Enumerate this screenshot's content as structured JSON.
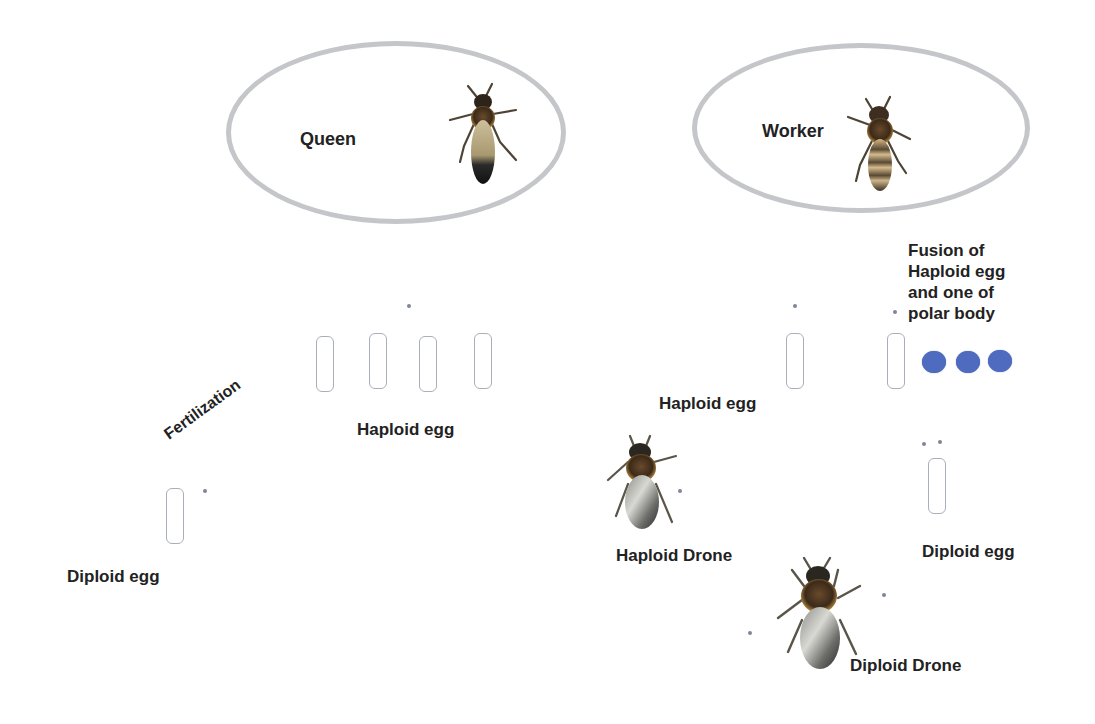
{
  "diagram": {
    "colors": {
      "background": "#ffffff",
      "ellipse_stroke": "#c4c6ca",
      "egg_outline": "#a9afb8",
      "polar_body": "#4f6bbf",
      "text": "#222222"
    },
    "left": {
      "caste_label": "Queen",
      "haploid_egg_label": "Haploid egg",
      "haploid_egg_count": 4,
      "process_label": "Fertilization",
      "diploid_egg_label": "Diploid egg"
    },
    "right": {
      "caste_label": "Worker",
      "haploid_egg_label": "Haploid egg",
      "fusion_label_lines": [
        "Fusion of",
        "Haploid egg",
        "and one of",
        "polar body"
      ],
      "polar_body_count": 3,
      "haploid_drone_label": "Haploid Drone",
      "diploid_egg_label": "Diploid egg",
      "diploid_drone_label": "Diploid Drone"
    },
    "icons": {
      "queen": "queen-bee-icon",
      "worker": "worker-bee-icon",
      "haploid_drone": "drone-bee-icon",
      "diploid_drone": "drone-bee-icon"
    }
  }
}
